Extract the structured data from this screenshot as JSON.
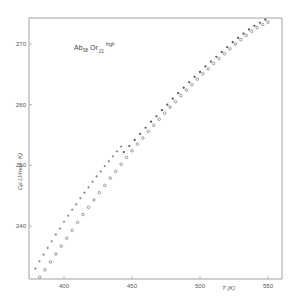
{
  "chart_data": {
    "type": "scatter",
    "title_parts": {
      "main1": "Ab",
      "sub1": "98",
      "main2": "Or",
      "sub2": "21",
      "sup": "high"
    },
    "xlabel": "T (K)",
    "ylabel": "Cp (J/mol · K)",
    "xlim": [
      377,
      562
    ],
    "ylim": [
      229,
      274
    ],
    "xticks": [
      400,
      450,
      500,
      550
    ],
    "yticks": [
      240,
      250,
      260,
      270
    ],
    "grid": false,
    "legend": "none",
    "series": [
      {
        "name": "crosses",
        "marker": "+",
        "points": [
          [
            379,
            233.0
          ],
          [
            382,
            234.2
          ],
          [
            385,
            235.3
          ],
          [
            388,
            236.4
          ],
          [
            391,
            237.5
          ],
          [
            394,
            238.6
          ],
          [
            397,
            239.6
          ],
          [
            400,
            240.7
          ],
          [
            403,
            241.7
          ],
          [
            406,
            242.7
          ],
          [
            409,
            243.6
          ],
          [
            412,
            244.6
          ],
          [
            415,
            245.5
          ],
          [
            418,
            246.4
          ],
          [
            421,
            247.3
          ],
          [
            424,
            248.2
          ],
          [
            427,
            249.0
          ],
          [
            430,
            249.9
          ],
          [
            433,
            250.7
          ],
          [
            436,
            251.5
          ],
          [
            439,
            252.3
          ],
          [
            442,
            253.1
          ]
        ]
      },
      {
        "name": "open circles",
        "marker": "o",
        "points": [
          [
            382,
            231.6
          ],
          [
            386,
            232.8
          ],
          [
            390,
            234.1
          ],
          [
            394,
            235.4
          ],
          [
            398,
            236.7
          ],
          [
            402,
            238.0
          ],
          [
            406,
            239.3
          ],
          [
            410,
            240.6
          ],
          [
            414,
            241.9
          ],
          [
            418,
            243.1
          ],
          [
            422,
            244.3
          ],
          [
            426,
            245.5
          ],
          [
            430,
            246.7
          ],
          [
            434,
            247.9
          ],
          [
            438,
            249.0
          ],
          [
            442,
            250.2
          ],
          [
            446,
            251.3
          ],
          [
            450,
            252.4
          ],
          [
            454,
            253.5
          ],
          [
            458,
            254.5
          ],
          [
            462,
            255.6
          ],
          [
            466,
            256.6
          ],
          [
            470,
            257.6
          ],
          [
            474,
            258.6
          ],
          [
            478,
            259.6
          ],
          [
            482,
            260.5
          ],
          [
            486,
            261.5
          ],
          [
            490,
            262.4
          ],
          [
            494,
            263.3
          ],
          [
            498,
            264.2
          ],
          [
            502,
            265.1
          ],
          [
            506,
            265.9
          ],
          [
            510,
            266.8
          ],
          [
            514,
            267.6
          ],
          [
            518,
            268.4
          ],
          [
            522,
            269.2
          ],
          [
            526,
            270.0
          ],
          [
            530,
            270.7
          ],
          [
            534,
            271.4
          ],
          [
            538,
            272.1
          ],
          [
            542,
            272.7
          ],
          [
            546,
            273.2
          ],
          [
            550,
            273.6
          ]
        ]
      },
      {
        "name": "filled dots",
        "marker": "•",
        "points": [
          [
            444,
            252.2
          ],
          [
            448,
            253.2
          ],
          [
            452,
            254.2
          ],
          [
            456,
            255.2
          ],
          [
            460,
            256.2
          ],
          [
            464,
            257.2
          ],
          [
            468,
            258.1
          ],
          [
            472,
            259.1
          ],
          [
            476,
            260.0
          ],
          [
            480,
            261.0
          ],
          [
            484,
            261.9
          ],
          [
            488,
            262.8
          ],
          [
            492,
            263.7
          ],
          [
            496,
            264.6
          ],
          [
            500,
            265.4
          ],
          [
            504,
            266.3
          ],
          [
            508,
            267.1
          ],
          [
            512,
            267.9
          ],
          [
            516,
            268.7
          ],
          [
            520,
            269.5
          ],
          [
            524,
            270.3
          ],
          [
            528,
            271.0
          ],
          [
            532,
            271.7
          ],
          [
            536,
            272.4
          ],
          [
            540,
            273.0
          ],
          [
            544,
            273.5
          ],
          [
            548,
            274.0
          ]
        ]
      }
    ]
  },
  "colors": {
    "axis": "#8a8a8a",
    "marker": "#555555",
    "background": "#ffffff"
  }
}
